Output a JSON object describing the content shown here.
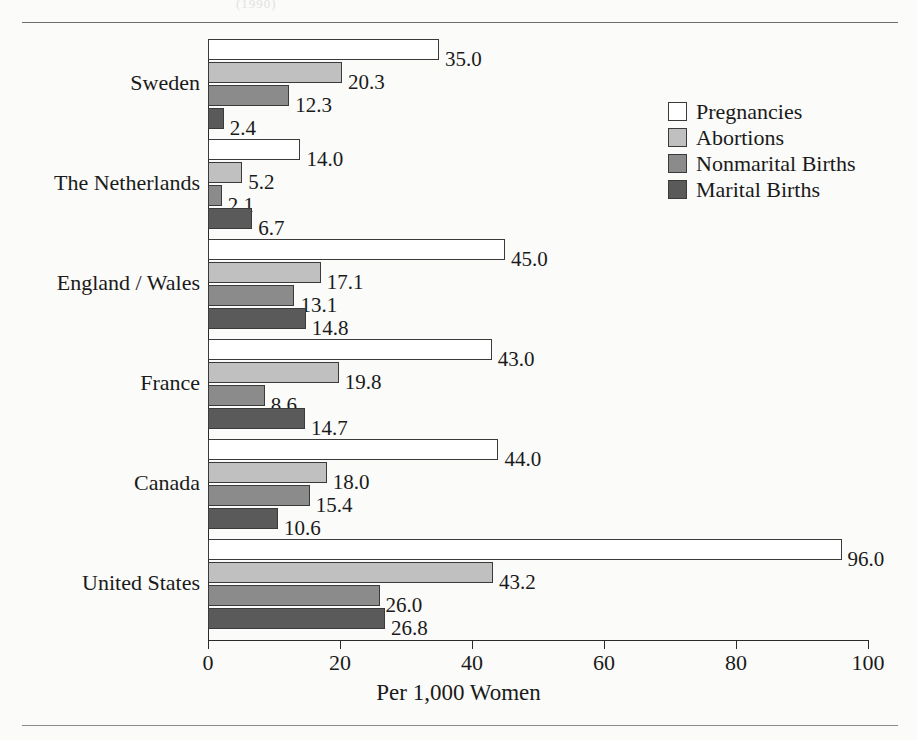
{
  "figure": {
    "paper_background": "#fbfbf9",
    "bleed_artifact_text": "(1990)"
  },
  "legend": {
    "position": "upper-right",
    "items": [
      {
        "label": "Pregnancies",
        "color": "#ffffff",
        "name": "legend-pregnancies"
      },
      {
        "label": "Abortions",
        "color": "#c0c0c0",
        "name": "legend-abortions"
      },
      {
        "label": "Nonmarital Births",
        "color": "#8b8b8b",
        "name": "legend-nonmarital-births"
      },
      {
        "label": "Marital Births",
        "color": "#5a5a5a",
        "name": "legend-marital-births"
      }
    ]
  },
  "chart_data": {
    "type": "bar",
    "orientation": "horizontal",
    "title": "",
    "xlabel": "Per 1,000 Women",
    "ylabel": "",
    "xlim": [
      0,
      100
    ],
    "xticks": [
      0,
      20,
      40,
      60,
      80,
      100
    ],
    "xticklabels": [
      "0",
      "20",
      "40",
      "60",
      "80",
      "100"
    ],
    "grid": false,
    "legend_position": "upper right",
    "value_label_format": "one-decimal",
    "categories": [
      "Sweden",
      "The Netherlands",
      "England / Wales",
      "France",
      "Canada",
      "United States"
    ],
    "series": [
      {
        "name": "Pregnancies",
        "color": "#ffffff",
        "values": [
          35.0,
          14.0,
          45.0,
          43.0,
          44.0,
          96.0
        ],
        "labels": [
          "35.0",
          "14.0",
          "45.0",
          "43.0",
          "44.0",
          "96.0"
        ]
      },
      {
        "name": "Abortions",
        "color": "#c0c0c0",
        "values": [
          20.3,
          5.2,
          17.1,
          19.8,
          18.0,
          43.2
        ],
        "labels": [
          "20.3",
          "5.2",
          "17.1",
          "19.8",
          "18.0",
          "43.2"
        ]
      },
      {
        "name": "Nonmarital Births",
        "color": "#8b8b8b",
        "values": [
          12.3,
          2.1,
          13.1,
          8.6,
          15.4,
          26.0
        ],
        "labels": [
          "12.3",
          "2.1",
          "13.1",
          "8.6",
          "15.4",
          "26.0"
        ]
      },
      {
        "name": "Marital Births",
        "color": "#5a5a5a",
        "values": [
          2.4,
          6.7,
          14.8,
          14.7,
          10.6,
          26.8
        ],
        "labels": [
          "2.4",
          "6.7",
          "14.8",
          "14.7",
          "10.6",
          "26.8"
        ]
      }
    ]
  }
}
